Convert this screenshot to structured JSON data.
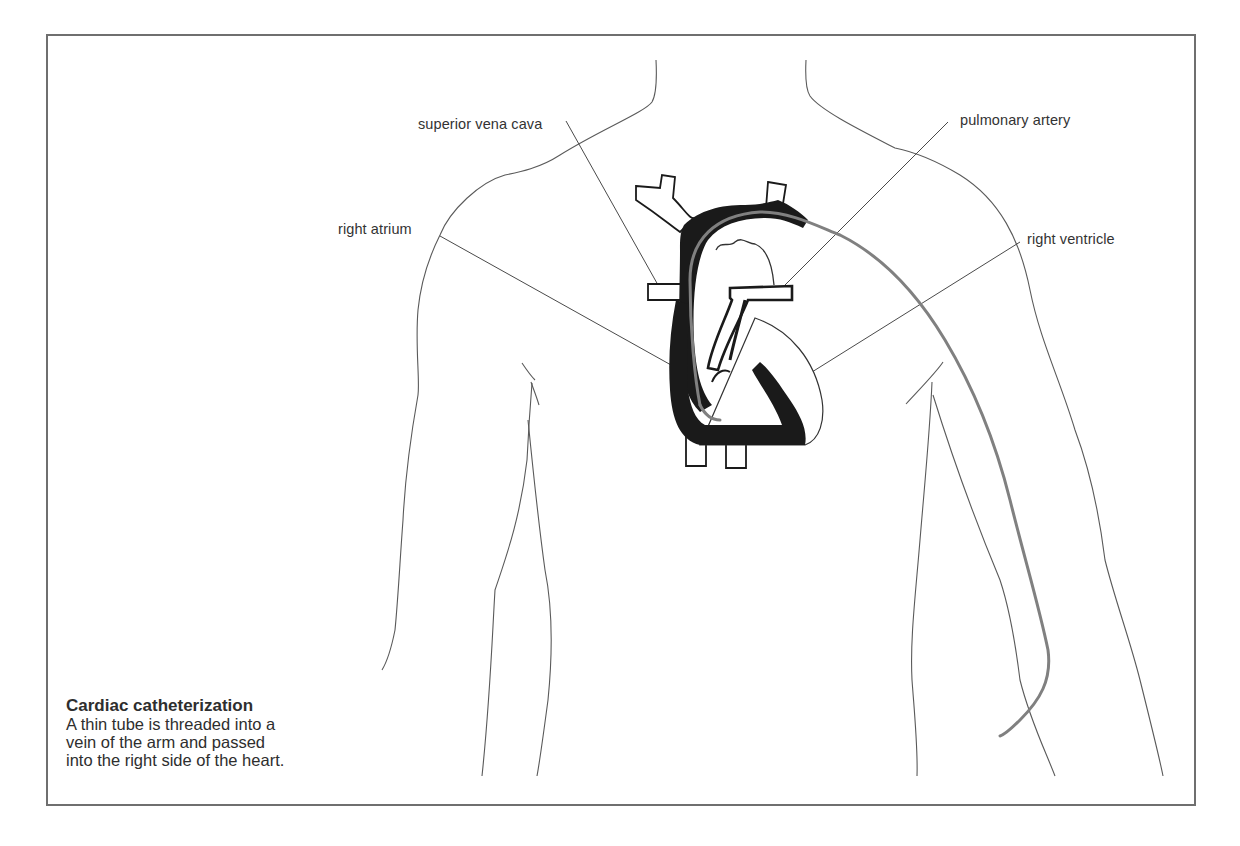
{
  "diagram": {
    "title": "Cardiac catheterization",
    "labels": {
      "superior_vena_cava": "superior vena cava",
      "pulmonary_artery": "pulmonary artery",
      "right_atrium": "right atrium",
      "right_ventricle": "right ventricle"
    },
    "caption": {
      "title": "Cardiac catheterization",
      "lines": [
        "A thin tube is threaded into a",
        "vein of the arm and passed",
        "into the right side of the heart."
      ]
    },
    "colors": {
      "outline": "#5a5a5a",
      "heart_wall": "#1a1a1a",
      "catheter": "#7a7a7a",
      "frame": "#6f6f6f",
      "text": "#333333"
    }
  }
}
